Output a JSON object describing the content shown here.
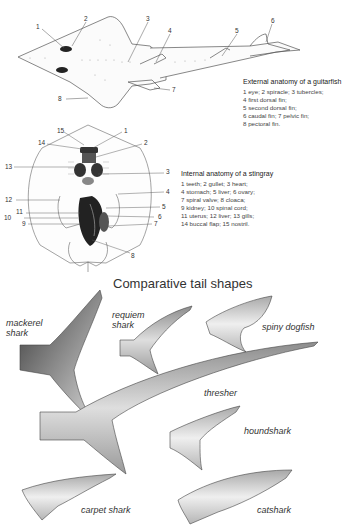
{
  "guitarfish": {
    "title": "External anatomy of a guitarfish",
    "legend_lines": [
      "1 eye; 2 spiracle; 3 tubercles;",
      "4 first dorsal fin;",
      "5 second dorsal fin;",
      "6 caudal fin; 7 pelvic fin;",
      "8 pectoral fin."
    ],
    "callouts": [
      "1",
      "2",
      "3",
      "4",
      "5",
      "6",
      "7",
      "8"
    ]
  },
  "stingray": {
    "title": "Internal anatomy of a stingray",
    "legend_lines": [
      "1 teeth; 2 gullet; 3 heart;",
      "4 stomach; 5 liver; 6 ovary;",
      "7 spiral valve; 8 cloaca;",
      "9 kidney; 10 spinal cord;",
      "11 uterus; 12 liver; 13 gills;",
      "14 buccal flap; 15 nostril."
    ],
    "callouts": [
      "1",
      "2",
      "3",
      "4",
      "5",
      "6",
      "7",
      "8",
      "9",
      "10",
      "11",
      "12",
      "13",
      "14",
      "15"
    ]
  },
  "tails": {
    "title": "Comparative tail shapes",
    "labels": {
      "mackerel": [
        "mackerel",
        "shark"
      ],
      "requiem": [
        "requiem",
        "shark"
      ],
      "spiny_dogfish": "spiny dogfish",
      "thresher": "thresher",
      "houndshark": "houndshark",
      "carpet": "carpet shark",
      "catshark": "catshark"
    }
  }
}
